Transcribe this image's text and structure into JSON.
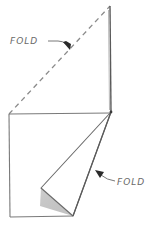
{
  "diagram": {
    "type": "paper-folding-instruction",
    "labels": {
      "top_fold": "FOLD",
      "bottom_fold": "FOLD"
    },
    "colors": {
      "line": "#7a7a7a",
      "dark_line": "#4a4a4a",
      "shade": "#b0b0b0",
      "background": "#ffffff"
    }
  }
}
